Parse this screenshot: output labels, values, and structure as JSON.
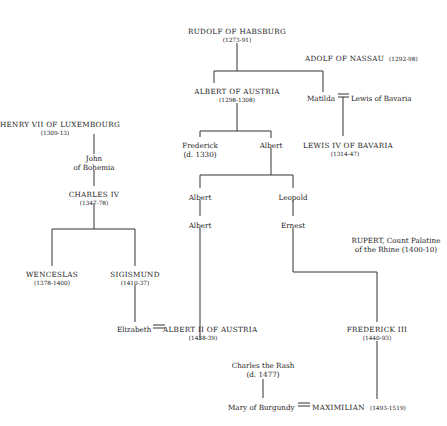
{
  "diagram": {
    "type": "family-tree",
    "line_color": "#333333",
    "nodes": {
      "rudolf": {
        "name": "RUDOLF OF HABSBURG",
        "dates": "(1273-91)"
      },
      "adolf": {
        "name": "ADOLF OF NASSAU",
        "dates": "(1292-98)"
      },
      "albert_austria": {
        "name": "ALBERT OF AUSTRIA",
        "dates": "(1298-1308)"
      },
      "matilda": {
        "name": "Matilda"
      },
      "lewis_bavaria": {
        "name": "Lewis of Bavaria"
      },
      "lewis_iv": {
        "name": "LEWIS IV OF BAVARIA",
        "dates": "(1314-47)"
      },
      "henry_vii": {
        "name": "HENRY VII OF LUXEMBOURG",
        "dates": "(1309-13)"
      },
      "john": {
        "name": "John",
        "name2": "of Bohemia"
      },
      "charles_iv": {
        "name": "CHARLES IV",
        "dates": "(1347-78)"
      },
      "frederick": {
        "name": "Frederick",
        "dates": "(d. 1330)"
      },
      "albert_son": {
        "name": "Albert"
      },
      "albert_g1": {
        "name": "Albert"
      },
      "albert_g2": {
        "name": "Albert"
      },
      "leopold": {
        "name": "Leopold"
      },
      "ernest": {
        "name": "Ernest"
      },
      "rupert": {
        "name": "RUPERT, Count Palatine",
        "name2": "of the Rhine (1400-10)"
      },
      "wenceslas": {
        "name": "WENCESLAS",
        "dates": "(1378-1400)"
      },
      "sigismund": {
        "name": "SIGISMUND",
        "dates": "(1410-37)"
      },
      "elizabeth": {
        "name": "Elizabeth"
      },
      "albert_ii": {
        "name": "ALBERT II OF AUSTRIA",
        "dates": "(1438-39)"
      },
      "frederick_iii": {
        "name": "FREDERICK III",
        "dates": "(1440-93)"
      },
      "charles_rash": {
        "name": "Charles the Rash",
        "dates": "(d. 1477)"
      },
      "mary": {
        "name": "Mary of Burgundy"
      },
      "maximilian": {
        "name": "MAXIMILIAN",
        "dates": "(1493-1519)"
      }
    },
    "marriage_symbol": "=="
  }
}
